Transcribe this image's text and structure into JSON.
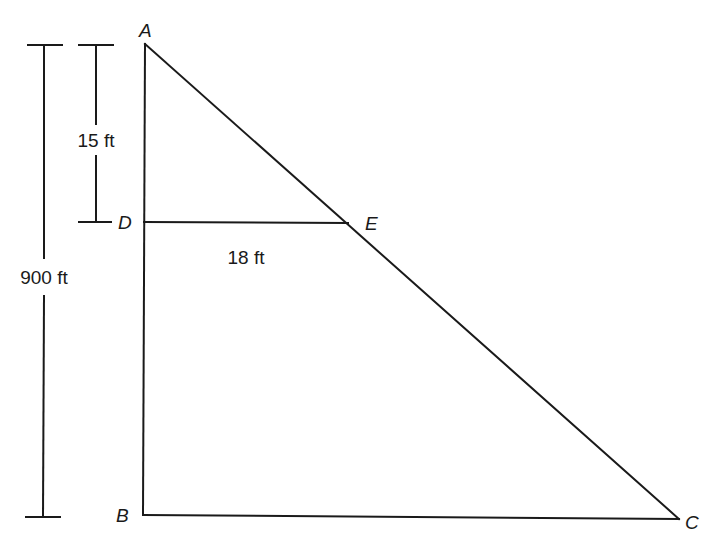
{
  "diagram": {
    "type": "similar-triangles",
    "vertices": {
      "A": {
        "label": "A",
        "x": 145,
        "y": 44
      },
      "B": {
        "label": "B",
        "x": 143,
        "y": 515
      },
      "C": {
        "label": "C",
        "x": 679,
        "y": 519
      },
      "D": {
        "label": "D",
        "x": 144,
        "y": 222
      },
      "E": {
        "label": "E",
        "x": 348,
        "y": 223
      }
    },
    "measurements": {
      "AD": "15 ft",
      "DE": "18 ft",
      "AB": "900 ft"
    },
    "colors": {
      "line": "#1a1a1a",
      "background": "#ffffff"
    }
  }
}
